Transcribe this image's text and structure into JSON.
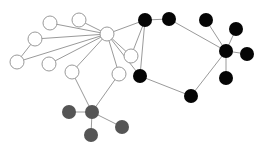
{
  "diagram": {
    "type": "network-graph",
    "width": 264,
    "height": 153,
    "colors": {
      "edge": "#9a9a9a",
      "white_group": "#ffffff",
      "black_group": "#050505",
      "gray_group": "#555555"
    },
    "node_radius": 7,
    "nodes": [
      {
        "id": "w_hub",
        "group": "white",
        "x": 107,
        "y": 34
      },
      {
        "id": "w1",
        "group": "white",
        "x": 50,
        "y": 23
      },
      {
        "id": "w2",
        "group": "white",
        "x": 79,
        "y": 20
      },
      {
        "id": "w3",
        "group": "white",
        "x": 35,
        "y": 39
      },
      {
        "id": "w4",
        "group": "white",
        "x": 17,
        "y": 62
      },
      {
        "id": "w5",
        "group": "white",
        "x": 49,
        "y": 64
      },
      {
        "id": "w6",
        "group": "white",
        "x": 72,
        "y": 72
      },
      {
        "id": "w7",
        "group": "white",
        "x": 131,
        "y": 56
      },
      {
        "id": "w8",
        "group": "white",
        "x": 119,
        "y": 74
      },
      {
        "id": "b1",
        "group": "black",
        "x": 145,
        "y": 20
      },
      {
        "id": "b2",
        "group": "black",
        "x": 169,
        "y": 19
      },
      {
        "id": "b3",
        "group": "black",
        "x": 140,
        "y": 76
      },
      {
        "id": "b4",
        "group": "black",
        "x": 191,
        "y": 96
      },
      {
        "id": "b_hub",
        "group": "black",
        "x": 226,
        "y": 51
      },
      {
        "id": "b5",
        "group": "black",
        "x": 206,
        "y": 20
      },
      {
        "id": "b6",
        "group": "black",
        "x": 236,
        "y": 29
      },
      {
        "id": "b7",
        "group": "black",
        "x": 247,
        "y": 54
      },
      {
        "id": "b8",
        "group": "black",
        "x": 226,
        "y": 78
      },
      {
        "id": "g_hub",
        "group": "gray",
        "x": 92,
        "y": 112
      },
      {
        "id": "g1",
        "group": "gray",
        "x": 69,
        "y": 112
      },
      {
        "id": "g2",
        "group": "gray",
        "x": 91,
        "y": 135
      },
      {
        "id": "g3",
        "group": "gray",
        "x": 122,
        "y": 127
      }
    ],
    "edges": [
      [
        "w_hub",
        "w1"
      ],
      [
        "w_hub",
        "w2"
      ],
      [
        "w_hub",
        "w3"
      ],
      [
        "w_hub",
        "w4"
      ],
      [
        "w_hub",
        "w5"
      ],
      [
        "w_hub",
        "w6"
      ],
      [
        "w_hub",
        "w7"
      ],
      [
        "w_hub",
        "w8"
      ],
      [
        "w_hub",
        "b1"
      ],
      [
        "w_hub",
        "b3"
      ],
      [
        "w3",
        "w4"
      ],
      [
        "w7",
        "b1"
      ],
      [
        "b1",
        "b2"
      ],
      [
        "b1",
        "b3"
      ],
      [
        "b2",
        "b_hub"
      ],
      [
        "b3",
        "b4"
      ],
      [
        "b4",
        "b_hub"
      ],
      [
        "b_hub",
        "b5"
      ],
      [
        "b_hub",
        "b6"
      ],
      [
        "b_hub",
        "b7"
      ],
      [
        "b_hub",
        "b8"
      ],
      [
        "w6",
        "g_hub"
      ],
      [
        "w8",
        "g_hub"
      ],
      [
        "g_hub",
        "g1"
      ],
      [
        "g_hub",
        "g2"
      ],
      [
        "g_hub",
        "g3"
      ]
    ]
  }
}
